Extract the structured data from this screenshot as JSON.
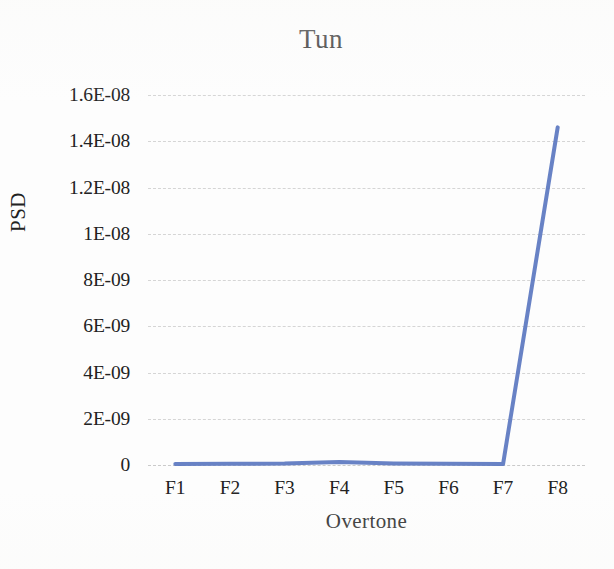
{
  "chart_data": {
    "type": "line",
    "title": "Tun",
    "xlabel": "Overtone",
    "ylabel": "PSD",
    "categories": [
      "F1",
      "F2",
      "F3",
      "F4",
      "F5",
      "F6",
      "F7",
      "F8"
    ],
    "values": [
      4e-11,
      5e-11,
      6e-11,
      1.3e-10,
      7e-11,
      5e-11,
      4e-11,
      1.46e-08
    ],
    "series": [
      {
        "name": "PSD",
        "values": [
          4e-11,
          5e-11,
          6e-11,
          1.3e-10,
          7e-11,
          5e-11,
          4e-11,
          1.46e-08
        ]
      }
    ],
    "ylim": [
      0,
      1.6e-08
    ],
    "ytick_values": [
      0,
      2e-09,
      4e-09,
      6e-09,
      8e-09,
      1e-08,
      1.2e-08,
      1.4e-08,
      1.6e-08
    ],
    "ytick_labels": [
      "0",
      "2E-09",
      "4E-09",
      "6E-09",
      "8E-09",
      "1E-08",
      "1.2E-08",
      "1.4E-08",
      "1.6E-08"
    ],
    "grid": true,
    "grid_style": "dashed",
    "grid_color": "#cfcfcf",
    "legend": false,
    "legend_position": "none",
    "line_color": "#5b77c0",
    "line_width": 4,
    "markers": false
  }
}
